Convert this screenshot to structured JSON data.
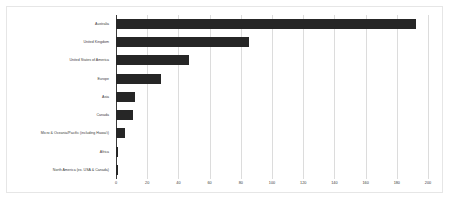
{
  "chart_data": {
    "type": "bar",
    "orientation": "horizontal",
    "title": "",
    "subtitle": "",
    "xlabel": "",
    "ylabel": "",
    "xlim": [
      0,
      200
    ],
    "grid": true,
    "legend": false,
    "legend_position": "none",
    "bar_color": "#262626",
    "gridline_color": "#dcdcdc",
    "axis_color": "#3a3a3a",
    "background_color": "#ffffff",
    "border_color": "#e6e6e6",
    "xticks": [
      0,
      20,
      40,
      60,
      80,
      100,
      120,
      140,
      160,
      180,
      200
    ],
    "xtick_labels": [
      "0",
      "20",
      "40",
      "60",
      "80",
      "100",
      "120",
      "140",
      "160",
      "180",
      "200"
    ],
    "categories": [
      "Australia",
      "United Kingdom",
      "United States of America",
      "Europe",
      "Asia",
      "Canada",
      "Micro & Oceania/Pacific (including Hawai'i)",
      "Africa",
      "North America (ex. USA & Canada)"
    ],
    "values": [
      192,
      85,
      47,
      29,
      12,
      11,
      6,
      1,
      1
    ]
  }
}
